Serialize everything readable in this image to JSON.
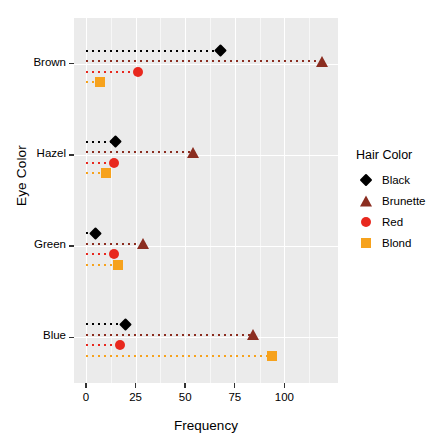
{
  "chart_data": {
    "type": "scatter",
    "title": "",
    "xlabel": "Frequency",
    "ylabel": "Eye Color",
    "xlim": [
      -6,
      127
    ],
    "xticks": [
      0,
      25,
      50,
      75,
      100
    ],
    "xticklabels": [
      "0",
      "25",
      "50",
      "75",
      "100"
    ],
    "categories": [
      "Brown",
      "Hazel",
      "Green",
      "Blue"
    ],
    "grid": true,
    "legend_position": "right",
    "legend_title": "Hair Color",
    "series": [
      {
        "name": "Black",
        "marker": "diamond",
        "color": "#000000",
        "values": [
          68,
          15,
          5,
          20
        ]
      },
      {
        "name": "Brunette",
        "marker": "triangle",
        "color": "#8b2d20",
        "values": [
          119,
          54,
          29,
          84
        ]
      },
      {
        "name": "Red",
        "marker": "circle",
        "color": "#e8281e",
        "values": [
          26,
          14,
          14,
          17
        ]
      },
      {
        "name": "Blond",
        "marker": "square",
        "color": "#f6a21d",
        "values": [
          7,
          10,
          16,
          94
        ]
      }
    ]
  },
  "axes": {
    "y_title": "Eye Color",
    "x_title": "Frequency",
    "y_ticklabels": [
      "Brown",
      "Hazel",
      "Green",
      "Blue"
    ],
    "x_ticklabels": [
      "0",
      "25",
      "50",
      "75",
      "100"
    ]
  },
  "legend": {
    "title": "Hair Color",
    "items": [
      {
        "label": "Black",
        "icon": "diamond-marker-icon"
      },
      {
        "label": "Brunette",
        "icon": "triangle-marker-icon"
      },
      {
        "label": "Red",
        "icon": "circle-marker-icon"
      },
      {
        "label": "Blond",
        "icon": "square-marker-icon"
      }
    ]
  },
  "colors": {
    "panel_background": "#ebebeb",
    "gridline": "#ffffff",
    "black": "#000000",
    "brunette": "#8b2d20",
    "red": "#e8281e",
    "blond": "#f6a21d"
  }
}
